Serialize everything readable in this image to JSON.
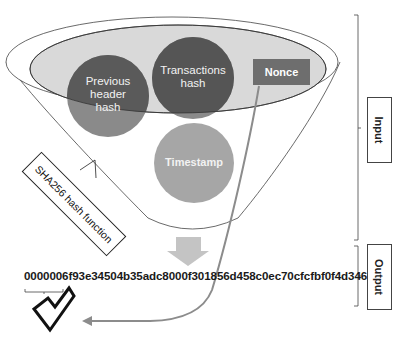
{
  "diagram": {
    "type": "bitcoin-block-hashing-funnel",
    "inputs": [
      {
        "id": "previous-header-hash",
        "label": "Previous header hash",
        "lines": [
          "Previous",
          "header",
          "hash"
        ],
        "shape": "circle",
        "color": "#5a5a5a"
      },
      {
        "id": "transactions-hash",
        "label": "Transactions hash",
        "lines": [
          "Transactions",
          "hash"
        ],
        "shape": "circle",
        "color": "#555555"
      },
      {
        "id": "nonce",
        "label": "Nonce",
        "shape": "rectangle",
        "color": "#6e6e6e"
      },
      {
        "id": "timestamp",
        "label": "Timestamp",
        "shape": "circle",
        "color": "#a3a3a3"
      }
    ],
    "function_label": "SHA256 hash function",
    "output_hash": "0000006f93e34504b35adc8000f301856d458c0ec70cfcfbf0f4d346",
    "leading_zeros_bracket": "0000006",
    "validity_icon": "checkmark",
    "side_labels": {
      "input": "Input",
      "output": "Output"
    },
    "colors": {
      "funnel_fill": "#d9d9d9",
      "dark_circle": "#595959",
      "light_circle": "#a6a6a6",
      "arrow": "#bfbfbf",
      "curve_arrow": "#8c8c8c"
    }
  }
}
